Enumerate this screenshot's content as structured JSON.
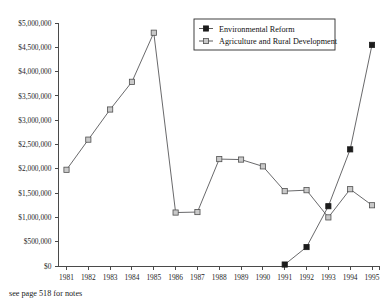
{
  "title_partial": "",
  "footnote": "see page 518 for notes",
  "legend": {
    "position": "top-right",
    "entries": [
      {
        "label": "Environmental Reform",
        "marker": "filled-square",
        "color": "#1c1c1c"
      },
      {
        "label": "Agriculture and Rural Development",
        "marker": "open-square",
        "color": "#c9c9c9"
      }
    ]
  },
  "chart_data": {
    "type": "line",
    "title": "",
    "xlabel": "",
    "ylabel": "",
    "grid": false,
    "legend_position": "top-right",
    "categories": [
      "1981",
      "1982",
      "1983",
      "1984",
      "1985",
      "1986",
      "1987",
      "1988",
      "1989",
      "1990",
      "1991",
      "1992",
      "1993",
      "1994",
      "1995"
    ],
    "x": [
      1981,
      1982,
      1983,
      1984,
      1985,
      1986,
      1987,
      1988,
      1989,
      1990,
      1991,
      1992,
      1993,
      1994,
      1995
    ],
    "ylim": [
      0,
      5000000
    ],
    "ytick_values": [
      0,
      500000,
      1000000,
      1500000,
      2000000,
      2500000,
      3000000,
      3500000,
      4000000,
      4500000,
      5000000
    ],
    "ytick_labels": [
      "$0",
      "$500,000",
      "$1,000,000",
      "$1,500,000",
      "$2,000,000",
      "$2,500,000",
      "$3,000,000",
      "$3,500,000",
      "$4,000,000",
      "$4,500,000",
      "$5,000,000"
    ],
    "series": [
      {
        "name": "Environmental Reform",
        "marker": "filled-square",
        "color": "#1c1c1c",
        "x": [
          1991,
          1992,
          1993,
          1994,
          1995
        ],
        "values": [
          30000,
          390000,
          1230000,
          2400000,
          4550000
        ]
      },
      {
        "name": "Agriculture and Rural Development",
        "marker": "open-square",
        "color": "#c9c9c9",
        "x": [
          1981,
          1982,
          1983,
          1984,
          1985,
          1986,
          1987,
          1988,
          1989,
          1990,
          1991,
          1992,
          1993,
          1994,
          1995
        ],
        "values": [
          1980000,
          2600000,
          3220000,
          3790000,
          4800000,
          1100000,
          1110000,
          2200000,
          2190000,
          2050000,
          1540000,
          1560000,
          1000000,
          1580000,
          1250000
        ]
      }
    ]
  }
}
